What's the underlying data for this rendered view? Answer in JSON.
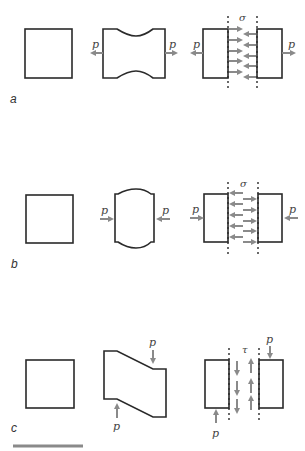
{
  "figure": {
    "rows": [
      {
        "id": "a",
        "label": "a",
        "type": "tension",
        "force_label": "p",
        "stress_symbol": "σ"
      },
      {
        "id": "b",
        "label": "b",
        "type": "compression",
        "force_label": "p",
        "stress_symbol": "σ"
      },
      {
        "id": "c",
        "label": "c",
        "type": "shear",
        "force_label": "p",
        "stress_symbol": "τ"
      }
    ],
    "colors": {
      "outline": "#2a2a2a",
      "arrow": "#8a8a8a",
      "scale_bar": "#8a8a8a"
    }
  }
}
